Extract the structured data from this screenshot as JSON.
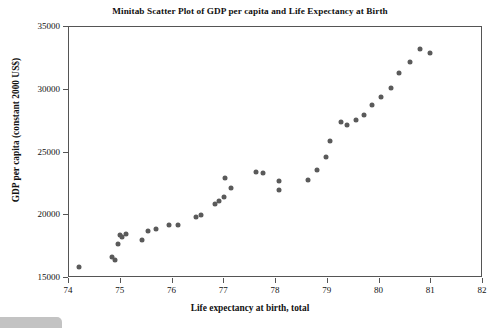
{
  "chart_data": {
    "type": "scatter",
    "title": "Minitab Scatter Plot of GDP per capita and Life Expectancy at Birth",
    "xlabel": "Life expectancy at birth, total",
    "ylabel": "GDP per capita (constant 2000 US$)",
    "xlim": [
      74,
      82
    ],
    "ylim": [
      15000,
      35000
    ],
    "xticks": [
      74,
      75,
      76,
      77,
      78,
      79,
      80,
      81,
      82
    ],
    "yticks": [
      15000,
      20000,
      25000,
      30000,
      35000
    ],
    "xtick_labels": [
      "74",
      "75",
      "76",
      "77",
      "78",
      "79",
      "80",
      "81",
      "82"
    ],
    "ytick_labels": [
      "15000",
      "20000",
      "25000",
      "30000",
      "35000"
    ],
    "grid": false,
    "legend": false,
    "marker": {
      "shape": "circle",
      "color": "#5a5a5a",
      "size": 5
    },
    "series": [
      {
        "name": "GDP per capita vs Life expectancy",
        "points": [
          [
            74.2,
            15900
          ],
          [
            74.84,
            16650
          ],
          [
            74.88,
            16450
          ],
          [
            74.94,
            17700
          ],
          [
            74.98,
            18400
          ],
          [
            75.02,
            18300
          ],
          [
            75.1,
            18500
          ],
          [
            75.42,
            18000
          ],
          [
            75.52,
            18750
          ],
          [
            75.68,
            18900
          ],
          [
            75.94,
            19200
          ],
          [
            76.1,
            19250
          ],
          [
            76.46,
            19900
          ],
          [
            76.56,
            20000
          ],
          [
            76.82,
            20900
          ],
          [
            76.9,
            21150
          ],
          [
            77.02,
            22950
          ],
          [
            77.14,
            22200
          ],
          [
            77.0,
            21450
          ],
          [
            77.62,
            23450
          ],
          [
            77.74,
            23350
          ],
          [
            78.06,
            22700
          ],
          [
            78.06,
            22050
          ],
          [
            78.62,
            22800
          ],
          [
            78.8,
            23600
          ],
          [
            78.96,
            24650
          ],
          [
            79.04,
            25950
          ],
          [
            79.26,
            27400
          ],
          [
            79.38,
            27200
          ],
          [
            79.54,
            27600
          ],
          [
            79.7,
            28000
          ],
          [
            79.86,
            28800
          ],
          [
            80.02,
            29400
          ],
          [
            80.22,
            30100
          ],
          [
            80.38,
            31300
          ],
          [
            80.58,
            32250
          ],
          [
            80.78,
            33250
          ],
          [
            80.98,
            32900
          ]
        ]
      }
    ]
  }
}
